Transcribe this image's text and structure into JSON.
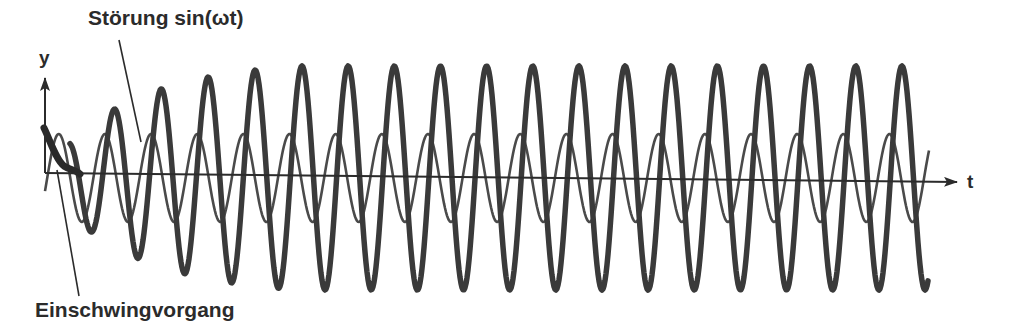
{
  "labels": {
    "disturbance": "Störung sin(ωt)",
    "transient": "Einschwingvorgang",
    "y_axis": "y",
    "t_axis": "t"
  },
  "colors": {
    "background": "#ffffff",
    "ink": "#2b2b2b",
    "thick_curve": "#3a3a3a",
    "thin_curve": "#4a4a4a"
  },
  "axes": {
    "origin": [
      45,
      173
    ],
    "y_axis_top": [
      45,
      78
    ],
    "t_axis_end": [
      957,
      182
    ]
  },
  "curves": {
    "response": {
      "description": "system response y(t), thick line, transient then steady state",
      "x_start": 44,
      "x_end": 928,
      "center_y": 178,
      "steady_amplitude": 112,
      "period_px": 46.15,
      "first_steady_peak_x": 302,
      "stroke_width": 5.5
    },
    "disturbance": {
      "description": "disturbance sin(ωt), thin line, leads response by ~90°",
      "x_start": 45,
      "x_end": 929,
      "center_y": 178,
      "amplitude": 44,
      "period_px": 46.15,
      "phase_lead_px": 12.5,
      "stroke_width": 2.6
    }
  },
  "pointers": {
    "disturbance_pointer": {
      "from": [
        119,
        40
      ],
      "to": [
        141,
        142
      ]
    },
    "transient_pointer": {
      "from": [
        57,
        170
      ],
      "to": [
        79,
        296
      ]
    }
  }
}
